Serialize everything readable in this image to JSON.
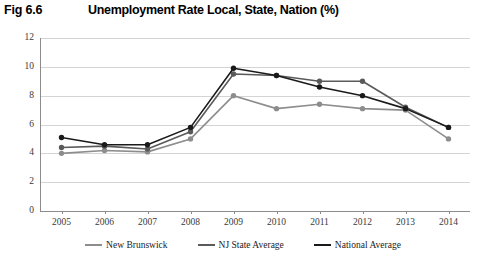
{
  "figure": {
    "label": "Fig 6.6",
    "title": "Unemployment Rate Local, State, Nation (%)"
  },
  "legend": {
    "position": "bottom-center",
    "items": [
      {
        "label": "New Brunswick",
        "color": "#8d8d8d"
      },
      {
        "label": "NJ State Average",
        "color": "#5a5a5a"
      },
      {
        "label": "National Average",
        "color": "#1a1a1a"
      }
    ]
  },
  "axis": {
    "y_ticks": [
      "0",
      "2",
      "4",
      "6",
      "8",
      "10",
      "12"
    ],
    "x_ticks": [
      "2005",
      "2006",
      "2007",
      "2008",
      "2009",
      "2010",
      "2011",
      "2012",
      "2013",
      "2014"
    ]
  },
  "chart_data": {
    "type": "line",
    "title": "Unemployment Rate Local, State, Nation (%)",
    "xlabel": "",
    "ylabel": "",
    "ylim": [
      0,
      12
    ],
    "ytick_step": 2,
    "grid": true,
    "legend_position": "bottom-center",
    "markers": "filled-circle",
    "categories": [
      "2005",
      "2006",
      "2007",
      "2008",
      "2009",
      "2010",
      "2011",
      "2012",
      "2013",
      "2014"
    ],
    "series": [
      {
        "name": "New Brunswick",
        "color": "#8d8d8d",
        "values": [
          4.0,
          4.2,
          4.1,
          5.0,
          8.0,
          7.1,
          7.4,
          7.1,
          7.0,
          5.0
        ]
      },
      {
        "name": "NJ State Average",
        "color": "#5a5a5a",
        "values": [
          4.4,
          4.5,
          4.3,
          5.5,
          9.5,
          9.4,
          9.0,
          9.0,
          7.2,
          5.8
        ]
      },
      {
        "name": "National Average",
        "color": "#1a1a1a",
        "values": [
          5.1,
          4.6,
          4.6,
          5.8,
          9.9,
          9.4,
          8.6,
          8.0,
          7.1,
          5.8
        ]
      }
    ]
  }
}
